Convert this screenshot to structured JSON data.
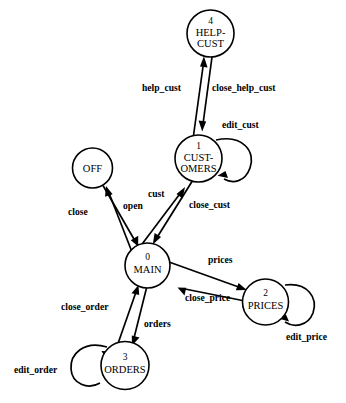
{
  "diagram": {
    "type": "state-transition-diagram",
    "title": "",
    "canvas": {
      "width": 346,
      "height": 403,
      "background": "#ffffff"
    },
    "stroke_color": "#000000",
    "fill_color": "#ffffff",
    "states": [
      {
        "id": "0",
        "name": "MAIN",
        "lines": [
          "MAIN"
        ],
        "cx": 147.5,
        "cy": 265.5,
        "r": 22.5,
        "id_dy": -6,
        "label_dy": 7
      },
      {
        "id": "1",
        "name": "CUSTOMERS",
        "lines": [
          "CUST-",
          "OMERS"
        ],
        "cx": 198.5,
        "cy": 158.5,
        "r": 23.5,
        "id_dy": -10,
        "label_dy": 2
      },
      {
        "id": "2",
        "name": "PRICES",
        "lines": [
          "PRICES"
        ],
        "cx": 265.5,
        "cy": 302.0,
        "r": 23.0,
        "id_dy": -6,
        "label_dy": 7
      },
      {
        "id": "3",
        "name": "ORDERS",
        "lines": [
          "ORDERS"
        ],
        "cx": 125.0,
        "cy": 365.5,
        "r": 24.0,
        "id_dy": -6,
        "label_dy": 7
      },
      {
        "id": "4",
        "name": "HELP-CUST",
        "lines": [
          "HELP-",
          "CUST"
        ],
        "cx": 210.5,
        "cy": 33.5,
        "r": 23.5,
        "id_dy": -10,
        "label_dy": 2
      },
      {
        "id": "off",
        "name": "OFF",
        "lines": [
          "OFF"
        ],
        "cx": 92.5,
        "cy": 168.0,
        "r": 20.0,
        "id_dy": null,
        "label_dy": 4
      }
    ],
    "transitions": [
      {
        "label": "help_cust",
        "from": "1",
        "to": "4",
        "label_x": 142,
        "label_y": 82
      },
      {
        "label": "close_help_cust",
        "from": "4",
        "to": "1",
        "label_x": 212,
        "label_y": 82
      },
      {
        "label": "edit_cust",
        "from": "1",
        "to": "1",
        "label_x": 222,
        "label_y": 119
      },
      {
        "label": "cust",
        "from": "0",
        "to": "1",
        "label_x": 148,
        "label_y": 188
      },
      {
        "label": "close_cust",
        "from": "1",
        "to": "0",
        "label_x": 189,
        "label_y": 199
      },
      {
        "label": "close",
        "from": "0",
        "to": "off",
        "label_x": 68,
        "label_y": 206
      },
      {
        "label": "open",
        "from": "off",
        "to": "0",
        "label_x": 123,
        "label_y": 200
      },
      {
        "label": "prices",
        "from": "0",
        "to": "2",
        "label_x": 208,
        "label_y": 254
      },
      {
        "label": "close_price",
        "from": "2",
        "to": "0",
        "label_x": 185,
        "label_y": 292
      },
      {
        "label": "edit_price",
        "from": "2",
        "to": "2",
        "label_x": 286,
        "label_y": 331
      },
      {
        "label": "close_order",
        "from": "3",
        "to": "0",
        "label_x": 61,
        "label_y": 301
      },
      {
        "label": "orders",
        "from": "0",
        "to": "3",
        "label_x": 144,
        "label_y": 318
      },
      {
        "label": "edit_order",
        "from": "3",
        "to": "3",
        "label_x": 14,
        "label_y": 364
      }
    ]
  }
}
